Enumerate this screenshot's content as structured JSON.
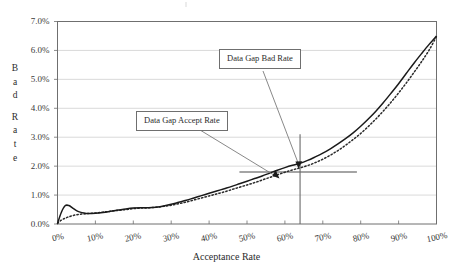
{
  "chart_data": {
    "type": "line",
    "title": "",
    "xlabel": "Acceptance Rate",
    "ylabel": "Bad Rate",
    "xlim": [
      0,
      100
    ],
    "ylim": [
      0,
      7
    ],
    "grid": true,
    "legend_position": "none",
    "x_tick_labels": [
      "0%",
      "10%",
      "20%",
      "30%",
      "40%",
      "50%",
      "60%",
      "70%",
      "80%",
      "90%",
      "100%"
    ],
    "x_tick_values": [
      0,
      10,
      20,
      30,
      40,
      50,
      60,
      70,
      80,
      90,
      100
    ],
    "y_tick_labels": [
      "0.0%",
      "1.0%",
      "2.0%",
      "3.0%",
      "4.0%",
      "5.0%",
      "6.0%",
      "7.0%"
    ],
    "y_tick_values": [
      0,
      1,
      2,
      3,
      4,
      5,
      6,
      7
    ],
    "x": [
      0,
      1,
      2,
      3,
      4,
      5,
      6,
      7,
      8,
      10,
      12,
      14,
      16,
      18,
      20,
      22,
      24,
      26,
      28,
      30,
      32,
      34,
      36,
      38,
      40,
      42,
      44,
      46,
      48,
      50,
      52,
      54,
      56,
      58,
      60,
      62,
      64,
      66,
      68,
      70,
      72,
      74,
      76,
      78,
      80,
      82,
      84,
      86,
      88,
      90,
      92,
      94,
      96,
      98,
      100
    ],
    "series": [
      {
        "name": "Bad Rate (solid)",
        "style": "solid",
        "color": "#1a1a1a",
        "values": [
          0.02,
          0.4,
          0.63,
          0.64,
          0.55,
          0.46,
          0.41,
          0.38,
          0.36,
          0.37,
          0.4,
          0.44,
          0.48,
          0.52,
          0.55,
          0.56,
          0.56,
          0.58,
          0.62,
          0.68,
          0.75,
          0.82,
          0.9,
          0.98,
          1.06,
          1.14,
          1.22,
          1.3,
          1.39,
          1.48,
          1.57,
          1.66,
          1.76,
          1.86,
          1.95,
          2.03,
          2.1,
          2.2,
          2.32,
          2.45,
          2.6,
          2.77,
          2.95,
          3.15,
          3.38,
          3.63,
          3.9,
          4.2,
          4.52,
          4.85,
          5.2,
          5.55,
          5.88,
          6.2,
          6.5
        ]
      },
      {
        "name": "Bad Rate (dotted)",
        "style": "dotted",
        "color": "#2a2a2a",
        "values": [
          0.02,
          0.13,
          0.2,
          0.25,
          0.29,
          0.32,
          0.34,
          0.35,
          0.36,
          0.38,
          0.41,
          0.44,
          0.47,
          0.5,
          0.53,
          0.55,
          0.56,
          0.58,
          0.61,
          0.65,
          0.7,
          0.76,
          0.83,
          0.9,
          0.97,
          1.04,
          1.11,
          1.19,
          1.27,
          1.35,
          1.43,
          1.52,
          1.61,
          1.7,
          1.79,
          1.87,
          1.94,
          2.02,
          2.12,
          2.24,
          2.38,
          2.54,
          2.72,
          2.92,
          3.13,
          3.37,
          3.63,
          3.91,
          4.21,
          4.53,
          4.87,
          5.23,
          5.6,
          6.0,
          6.48
        ]
      }
    ],
    "annotations": [
      {
        "label": "Data Gap Bad Rate",
        "points_to_x": 64,
        "points_to_y": 2.0,
        "type": "callout-with-arrow"
      },
      {
        "label": "Data Gap Accept Rate",
        "points_to_x": 58,
        "points_to_y": 1.8,
        "type": "callout-with-arrow"
      }
    ],
    "reference_lines": [
      {
        "name": "data-gap-bad-rate-horizontal",
        "orientation": "horizontal",
        "value": 1.8,
        "from_x": 48,
        "to_x": 79
      },
      {
        "name": "data-gap-accept-rate-vertical",
        "orientation": "vertical",
        "value": 64,
        "from_y": 0,
        "to_y": 3.1
      }
    ]
  },
  "axes": {
    "x_title": "Acceptance Rate",
    "y_title_letters": [
      "B",
      "a",
      "d",
      "",
      "R",
      "a",
      "t",
      "e"
    ]
  },
  "callouts": {
    "bad_rate": "Data Gap Bad Rate",
    "accept_rate": "Data Gap Accept Rate"
  },
  "colors": {
    "axis": "#6f6f6f",
    "grid": "#c8c8c8",
    "series_solid": "#1a1a1a",
    "series_dotted": "#2a2a2a",
    "callout_border": "#6f6f6f",
    "leader": "#7a7a7a",
    "reference_line": "#5a5a5a",
    "background": "#ffffff"
  }
}
